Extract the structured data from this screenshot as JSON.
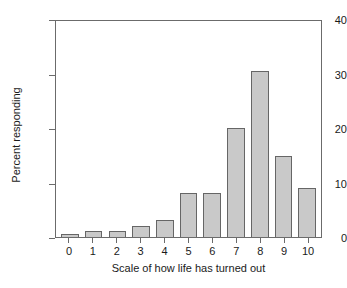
{
  "chart_data": {
    "type": "bar",
    "title": "",
    "xlabel": "Scale of how life has turned out",
    "ylabel": "Percent responding",
    "categories": [
      "0",
      "1",
      "2",
      "3",
      "4",
      "5",
      "6",
      "7",
      "8",
      "9",
      "10"
    ],
    "values": [
      0.5,
      1.1,
      1.1,
      2.0,
      3.1,
      8.0,
      8.0,
      20.0,
      30.4,
      14.8,
      9.0
    ],
    "ylim": [
      0,
      40
    ],
    "yticks": [
      0,
      10,
      20,
      30,
      40
    ],
    "ytick_labels": [
      "0",
      "10",
      "20",
      "30",
      "40"
    ],
    "grid": false,
    "legend": false,
    "bar_fill_color": "#c9c9c9",
    "bar_edge_color": "#666666",
    "axis_color": "#6b6b6b",
    "text_color": "#1a1a1a",
    "background_color": "#ffffff"
  }
}
